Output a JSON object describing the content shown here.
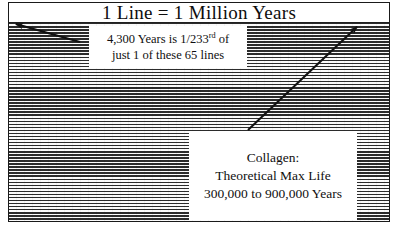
{
  "figure": {
    "title": "1 Line = 1 Million Years",
    "frame_color": "#1a1a1a",
    "background_color": "#ffffff",
    "stripe_dark_color": "#2b2b2b",
    "stripe_light_color": "#fbfbfb"
  },
  "callouts": {
    "lines": {
      "line1_prefix": "4,300 Years is 1/233",
      "line1_sup": "rd",
      "line1_suffix": " of",
      "line2": "just 1 of these 65 lines"
    },
    "collagen": {
      "line1": "Collagen:",
      "line2": "Theoretical Max Life",
      "line3": "300,000 to 900,000 Years"
    }
  },
  "arrows": [
    {
      "name": "arrow-to-upper-left",
      "from_x": 80,
      "from_y": 42,
      "to_x": 12,
      "to_y": 23,
      "color": "#111111"
    },
    {
      "name": "arrow-to-upper-right",
      "from_x": 248,
      "from_y": 130,
      "to_x": 360,
      "to_y": 24,
      "color": "#111111"
    }
  ],
  "chart_data": {
    "type": "bar",
    "title": "1 Line = 1 Million Years",
    "categories": [
      "Collagen theoretical max life (low)",
      "Collagen theoretical max life (high)",
      "Claimed radiocarbon age"
    ],
    "values": [
      300000,
      900000,
      4300
    ],
    "unit": "years",
    "xlabel": "",
    "ylabel": "Years",
    "ylim": [
      0,
      65000000
    ],
    "grid": true,
    "legend": null,
    "annotations": [
      "Each ruled line represents 1,000,000 years",
      "Total ruled lines shown: 65",
      "4,300 Years is 1/233rd of just 1 of these 65 lines",
      "Collagen: Theoretical Max Life 300,000 to 900,000 Years"
    ],
    "line_count": 65,
    "years_per_line": 1000000,
    "fraction_of_one_line": "1/233"
  }
}
